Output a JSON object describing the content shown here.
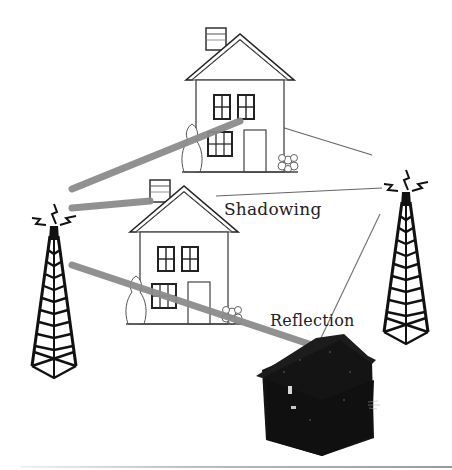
{
  "diagram": {
    "type": "wireless multipath propagation illustration",
    "labels": {
      "shadowing": "Shadowing",
      "reflection": "Reflection"
    },
    "elements": [
      {
        "id": "house-top",
        "kind": "house",
        "style": "outline"
      },
      {
        "id": "house-middle",
        "kind": "house",
        "style": "outline"
      },
      {
        "id": "house-dark",
        "kind": "house",
        "style": "filled-dark"
      },
      {
        "id": "tower-left",
        "kind": "transmission-tower",
        "role": "transmitter"
      },
      {
        "id": "tower-right",
        "kind": "transmission-tower",
        "role": "receiver"
      }
    ],
    "signal_paths": [
      {
        "from": "tower-left",
        "to": "house-top",
        "style": "thick-gray"
      },
      {
        "from": "tower-left",
        "to": "house-middle",
        "style": "thick-gray"
      },
      {
        "from": "tower-left",
        "to": "house-dark",
        "style": "thick-gray",
        "annotation": "Reflection"
      },
      {
        "from": "house-top",
        "to": "tower-right",
        "style": "thin-line"
      },
      {
        "from": "house-middle",
        "to": "tower-right",
        "style": "thin-line",
        "annotation": "Shadowing"
      },
      {
        "from": "house-dark",
        "to": "tower-right",
        "style": "thin-line"
      }
    ],
    "colors": {
      "thick_path": "#8c8c8c",
      "thin_path": "#6e6e6e",
      "outline": "#2a2a2a",
      "dark_house": "#141414",
      "background": "#ffffff"
    }
  }
}
